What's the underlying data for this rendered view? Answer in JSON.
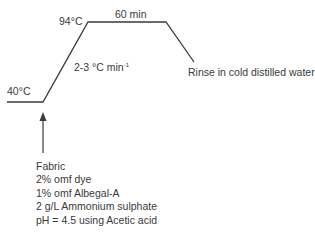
{
  "diagram": {
    "type": "dyeing-temperature-profile",
    "labels": {
      "start_temp": "40°C",
      "peak_temp": "94°C",
      "hold_time": "60 min",
      "ramp_rate_prefix": "2-3 °C min",
      "ramp_rate_exponent": "-1",
      "end_step": "Rinse in cold distilled water"
    },
    "recipe": {
      "items": [
        "Fabric",
        "2% omf dye",
        "1% omf Albegal-A",
        "2 g/L Ammonium sulphate",
        "pH = 4.5 using Acetic acid"
      ]
    },
    "colors": {
      "line": "#3a3a3a",
      "text": "#3a3a3a",
      "background": "#ffffff"
    }
  }
}
